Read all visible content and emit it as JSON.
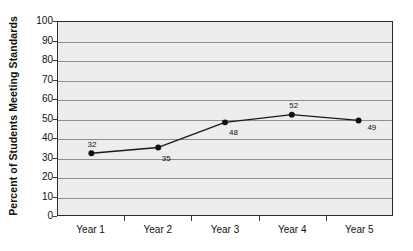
{
  "chart_data": {
    "type": "line",
    "title": "",
    "xlabel": "",
    "ylabel": "Percent of Students Meeting Standards",
    "categories": [
      "Year 1",
      "Year 2",
      "Year 3",
      "Year 4",
      "Year 5"
    ],
    "values": [
      32,
      35,
      48,
      52,
      49
    ],
    "point_labels": [
      "32",
      "35",
      "48",
      "52",
      "49"
    ],
    "label_positions": [
      "above",
      "below-right",
      "below-right",
      "above",
      "right"
    ],
    "ylim": [
      0,
      100
    ],
    "ytick_labels": [
      "0",
      "10",
      "20",
      "30",
      "40",
      "50",
      "60",
      "70",
      "80",
      "90",
      "100"
    ],
    "ytick_values": [
      0,
      10,
      20,
      30,
      40,
      50,
      60,
      70,
      80,
      90,
      100
    ],
    "grid": "horizontal",
    "legend": "none",
    "series": [
      {
        "name": "Percent of Students Meeting Standards",
        "values": [
          32,
          35,
          48,
          52,
          49
        ]
      }
    ],
    "colors": {
      "plot_background": "#ededed",
      "plot_border": "#2b2b2b",
      "gridline": "#8e8e8e",
      "line": "#1a1a1a",
      "marker": "#111111",
      "text": "#111111",
      "page_background": "#ffffff"
    }
  }
}
